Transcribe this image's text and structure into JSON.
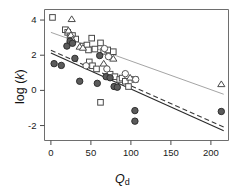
{
  "chart_data": {
    "type": "scatter",
    "title": "",
    "xlabel": "Qd",
    "ylabel": "log (k)",
    "xlim": [
      -8,
      222
    ],
    "ylim": [
      -2.85,
      4.6
    ],
    "xticks": [
      0,
      50,
      100,
      150,
      200
    ],
    "yticks": [
      -2,
      0,
      2,
      4
    ],
    "xtick_labels": [
      "0",
      "50",
      "100",
      "150",
      "200"
    ],
    "ytick_labels": [
      "-2",
      "0",
      "2",
      "4"
    ],
    "grid": false,
    "legend": "none",
    "series": [
      {
        "name": "open-square",
        "marker": "open-square",
        "color": "#ffffff",
        "edge_color": "#4a4a4a",
        "points": [
          {
            "x": 2,
            "y": 4.15
          },
          {
            "x": 18,
            "y": 3.45
          },
          {
            "x": 21,
            "y": 3.3
          },
          {
            "x": 24,
            "y": 3.05
          },
          {
            "x": 27,
            "y": 3.12
          },
          {
            "x": 31,
            "y": 2.92
          },
          {
            "x": 40,
            "y": 2.52
          },
          {
            "x": 45,
            "y": 2.58
          },
          {
            "x": 47,
            "y": 2.3
          },
          {
            "x": 51,
            "y": 2.97
          },
          {
            "x": 55,
            "y": 2.35
          },
          {
            "x": 62,
            "y": 2.7
          },
          {
            "x": 48,
            "y": 1.62
          },
          {
            "x": 52,
            "y": 1.4
          },
          {
            "x": 57,
            "y": 1.22
          },
          {
            "x": 66,
            "y": 2.22
          },
          {
            "x": 71,
            "y": 2.3
          },
          {
            "x": 78,
            "y": 2.2
          },
          {
            "x": 74,
            "y": 0.92
          },
          {
            "x": 80,
            "y": 0.78
          },
          {
            "x": 86,
            "y": 0.62
          },
          {
            "x": 89,
            "y": 0.7
          },
          {
            "x": 93,
            "y": 0.52
          },
          {
            "x": 62,
            "y": -0.68
          },
          {
            "x": 97,
            "y": 0.22
          },
          {
            "x": 105,
            "y": 0.62
          }
        ]
      },
      {
        "name": "triangle",
        "marker": "open-triangle",
        "color": "#ffffff",
        "edge_color": "#4a4a4a",
        "points": [
          {
            "x": 26,
            "y": 4.05
          },
          {
            "x": 22,
            "y": 3.4
          },
          {
            "x": 25,
            "y": 3.15
          },
          {
            "x": 27,
            "y": 2.88
          },
          {
            "x": 36,
            "y": 2.48
          },
          {
            "x": 40,
            "y": 2.42
          },
          {
            "x": 66,
            "y": 1.52
          },
          {
            "x": 78,
            "y": 1.8
          },
          {
            "x": 99,
            "y": 0.72
          },
          {
            "x": 213,
            "y": 0.35
          }
        ]
      },
      {
        "name": "filled-circle",
        "marker": "filled-circle",
        "color": "#5b5b5b",
        "edge_color": "#2e2e2e",
        "points": [
          {
            "x": 4,
            "y": 1.52
          },
          {
            "x": 13,
            "y": 1.42
          },
          {
            "x": 20,
            "y": 2.52
          },
          {
            "x": 24,
            "y": 2.8
          },
          {
            "x": 27,
            "y": 2.68
          },
          {
            "x": 30,
            "y": 1.82
          },
          {
            "x": 36,
            "y": 0.52
          },
          {
            "x": 58,
            "y": 0.4
          },
          {
            "x": 61,
            "y": 1.98
          },
          {
            "x": 69,
            "y": 0.78
          },
          {
            "x": 74,
            "y": 0.72
          },
          {
            "x": 79,
            "y": 0.22
          },
          {
            "x": 83,
            "y": 0.18
          },
          {
            "x": 105,
            "y": -1.15
          },
          {
            "x": 105,
            "y": -1.75
          },
          {
            "x": 213,
            "y": -1.2
          }
        ]
      },
      {
        "name": "open-circle",
        "marker": "open-circle",
        "color": "#ffffff",
        "edge_color": "#555555",
        "points": [
          {
            "x": 44,
            "y": 1.4
          },
          {
            "x": 67,
            "y": 2.38
          },
          {
            "x": 72,
            "y": 1.92
          },
          {
            "x": 70,
            "y": 1.22
          },
          {
            "x": 93,
            "y": 0.95
          },
          {
            "x": 106,
            "y": 0.62
          }
        ]
      }
    ],
    "trend_lines": [
      {
        "name": "upper-solid",
        "style": "solid",
        "color": "#9a9a9a",
        "x0": 0,
        "y0": 3.3,
        "x1": 216,
        "y1": -0.22
      },
      {
        "name": "middle-dashed",
        "style": "dashed",
        "color": "#3a3a3a",
        "x0": 0,
        "y0": 2.28,
        "x1": 216,
        "y1": -2.08
      },
      {
        "name": "lower-solid",
        "style": "solid",
        "color": "#2a2a2a",
        "x0": 0,
        "y0": 2.12,
        "x1": 216,
        "y1": -2.3
      }
    ]
  }
}
